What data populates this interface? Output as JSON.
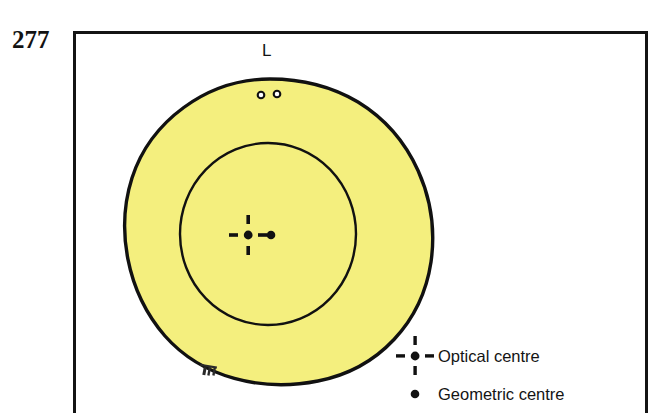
{
  "page": {
    "page_number": "277",
    "background_color": "#ffffff",
    "frame_color": "#141414"
  },
  "figure": {
    "lens_label": "L",
    "lens_fill_color": "#f4ef7e",
    "lens_outline_color": "#111111",
    "marks": {
      "optical_centre_icon": "dashed-crosshair-with-dot",
      "geometric_centre_icon": "filled-dot",
      "engraving_circles_icon": "two-small-open-circles",
      "bottom_engraving_icon": "tiny-engraving-marks"
    }
  },
  "legend": {
    "items": [
      {
        "icon": "dashed-crosshair-with-dot",
        "label": "Optical centre"
      },
      {
        "icon": "filled-dot",
        "label": "Geometric centre"
      }
    ]
  }
}
